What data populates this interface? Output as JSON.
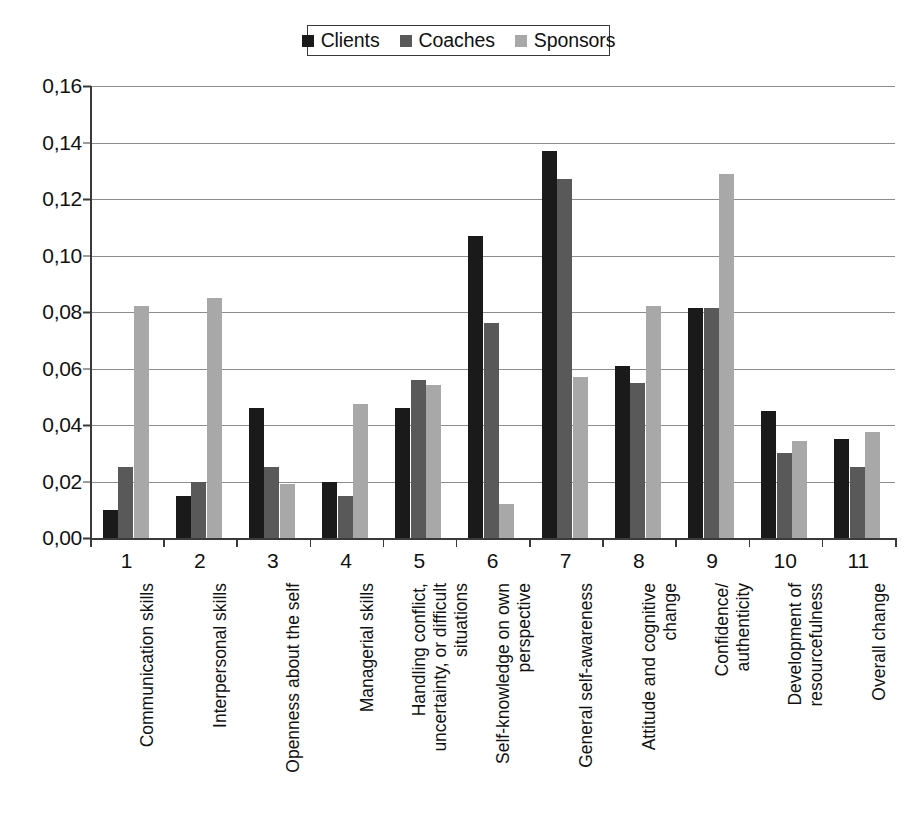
{
  "legend": {
    "entries": [
      {
        "label": "Clients",
        "color": "#1a1a1a"
      },
      {
        "label": "Coaches",
        "color": "#595959"
      },
      {
        "label": "Sponsors",
        "color": "#a8a8a8"
      }
    ]
  },
  "yaxis": {
    "ticks": [
      "0,16",
      "0,14",
      "0,12",
      "0,10",
      "0,08",
      "0,06",
      "0,04",
      "0,02",
      "0,00"
    ]
  },
  "xaxis": {
    "numbers": [
      "1",
      "2",
      "3",
      "4",
      "5",
      "6",
      "7",
      "8",
      "9",
      "10",
      "11"
    ],
    "categories": [
      "Communication skills",
      "Interpersonal skills",
      "Openness about the self",
      "Managerial skills",
      "Handling conflict,\nuncertainty, or difficult\nsituations",
      "Self-knowledge on own\nperspective",
      "General self-awareness",
      "Attitude and cognitive\nchange",
      "Confidence/\nauthenticity",
      "Development of\nresourcefulness",
      "Overall change"
    ]
  },
  "chart_data": {
    "type": "bar",
    "title": "",
    "subtitle": "",
    "xlabel": "",
    "ylabel": "",
    "ylim": [
      0,
      0.16
    ],
    "ytick_step": 0.02,
    "grid": true,
    "legend_position": "top-center",
    "decimal_separator": ",",
    "categories": [
      "Communication skills",
      "Interpersonal skills",
      "Openness about the self",
      "Managerial skills",
      "Handling conflict, uncertainty, or difficult situations",
      "Self-knowledge on own perspective",
      "General self-awareness",
      "Attitude and cognitive change",
      "Confidence/authenticity",
      "Development of resourcefulness",
      "Overall change"
    ],
    "category_numbers": [
      1,
      2,
      3,
      4,
      5,
      6,
      7,
      8,
      9,
      10,
      11
    ],
    "series": [
      {
        "name": "Clients",
        "color": "#1a1a1a",
        "values": [
          0.01,
          0.015,
          0.046,
          0.02,
          0.046,
          0.107,
          0.137,
          0.061,
          0.0815,
          0.045,
          0.035
        ]
      },
      {
        "name": "Coaches",
        "color": "#595959",
        "values": [
          0.025,
          0.02,
          0.025,
          0.015,
          0.056,
          0.076,
          0.127,
          0.055,
          0.0815,
          0.03,
          0.025
        ]
      },
      {
        "name": "Sponsors",
        "color": "#a8a8a8",
        "values": [
          0.082,
          0.085,
          0.019,
          0.0475,
          0.054,
          0.012,
          0.057,
          0.082,
          0.129,
          0.0345,
          0.0375
        ]
      }
    ]
  }
}
